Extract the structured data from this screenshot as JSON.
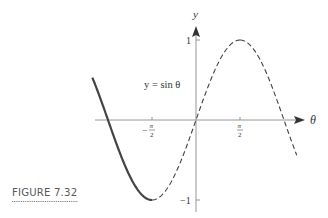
{
  "figure": {
    "caption": "FIGURE 7.32",
    "curve_label": "y = sin θ",
    "x_axis_label": "θ",
    "y_axis_label": "y",
    "x_ticks": [
      {
        "value": "-π/2",
        "num": "π",
        "den": "2",
        "sign": "−"
      },
      {
        "value": "π/2",
        "num": "π",
        "den": "2",
        "sign": ""
      }
    ],
    "y_ticks": [
      {
        "value": 1,
        "label": "1"
      },
      {
        "value": -1,
        "label": "−1"
      }
    ]
  },
  "chart_data": {
    "type": "line",
    "title": "",
    "function": "y = sin θ",
    "xlabel": "θ",
    "ylabel": "y",
    "xlim": [
      -3.5,
      3.3
    ],
    "ylim": [
      -1,
      1
    ],
    "x_tick_labels": [
      "−π/2",
      "π/2"
    ],
    "y_tick_labels": [
      "1",
      "−1"
    ],
    "grid": false,
    "legend": null,
    "series": [
      {
        "name": "sin θ (restricted, solid)",
        "style": "solid",
        "domain": [
          -1.5708,
          1.5708
        ],
        "x": [
          -1.5708,
          -0.7854,
          0,
          0.7854,
          1.5708
        ],
        "y": [
          -1,
          -0.7071,
          0,
          0.7071,
          1
        ]
      },
      {
        "name": "sin θ (left, dashed)",
        "style": "dashed",
        "domain": [
          -3.7,
          -1.5708
        ],
        "x": [
          -3.7,
          -3.1416,
          -2.3562,
          -1.5708
        ],
        "y": [
          0.53,
          0,
          -0.7071,
          -1
        ]
      },
      {
        "name": "sin θ (right, dashed)",
        "style": "dashed",
        "domain": [
          1.5708,
          3.6
        ],
        "x": [
          1.5708,
          2.3562,
          3.1416,
          3.6
        ],
        "y": [
          1,
          0.7071,
          0,
          -0.44
        ]
      }
    ],
    "annotations": [
      "y = sin θ",
      "FIGURE 7.32"
    ]
  }
}
